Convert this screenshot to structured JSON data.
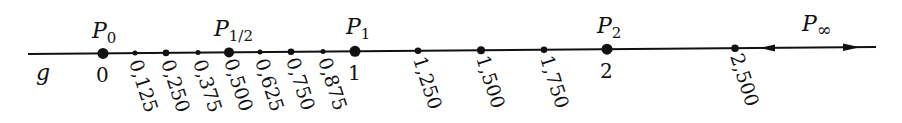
{
  "diagram": {
    "type": "number-line",
    "line_label": "g",
    "unit_px": 252,
    "origin_px": 103,
    "colors": {
      "ink": "#111111",
      "background": "#ffffff"
    },
    "named_points": [
      {
        "id": "p0",
        "name": "P",
        "sub": "0",
        "value": 0,
        "tick_label": "0"
      },
      {
        "id": "phalf",
        "name": "P",
        "sub": "1/2",
        "value": 0.5,
        "tick_label": ""
      },
      {
        "id": "p1",
        "name": "P",
        "sub": "1",
        "value": 1,
        "tick_label": "1"
      },
      {
        "id": "p2",
        "name": "P",
        "sub": "2",
        "value": 2,
        "tick_label": "2"
      },
      {
        "id": "pinf",
        "name": "P",
        "sub": "∞",
        "value": null,
        "tick_label": ""
      }
    ],
    "ticks": [
      {
        "value": 0.125,
        "label": "0,125",
        "size": "small"
      },
      {
        "value": 0.25,
        "label": "0,250",
        "size": "medium"
      },
      {
        "value": 0.375,
        "label": "0,375",
        "size": "small"
      },
      {
        "value": 0.5,
        "label": "0,500",
        "size": "large"
      },
      {
        "value": 0.625,
        "label": "0,625",
        "size": "small"
      },
      {
        "value": 0.75,
        "label": "0,750",
        "size": "medium"
      },
      {
        "value": 0.875,
        "label": "0,875",
        "size": "small"
      },
      {
        "value": 1.25,
        "label": "1,250",
        "size": "medium"
      },
      {
        "value": 1.5,
        "label": "1,500",
        "size": "medium"
      },
      {
        "value": 1.75,
        "label": "1,750",
        "size": "medium"
      },
      {
        "value": 2.5,
        "label": "2,500",
        "size": "medium"
      }
    ],
    "arrows": [
      {
        "direction": "left",
        "description": "arrow pointing toward finite points"
      },
      {
        "direction": "right",
        "description": "arrow pointing toward infinity"
      }
    ]
  }
}
